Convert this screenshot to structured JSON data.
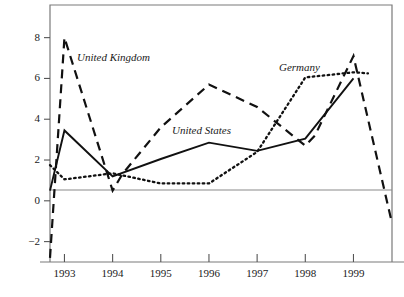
{
  "chart_data": {
    "type": "line",
    "title": "",
    "subtitle": "",
    "xlabel": "",
    "ylabel": "",
    "xlim": [
      1992.7,
      1999.8
    ],
    "ylim": [
      -3.0,
      9.6
    ],
    "grid": false,
    "legend_position": "inline-annotations",
    "zero_line": 0,
    "x_ticks": [
      "1993",
      "1994",
      "1995",
      "1996",
      "1997",
      "1998",
      "1999"
    ],
    "x_tick_values": [
      1993,
      1994,
      1995,
      1996,
      1997,
      1998,
      1999
    ],
    "y_ticks": [
      "8",
      "6",
      "4",
      "2",
      "0",
      "−2"
    ],
    "y_tick_values": [
      8,
      6,
      4,
      2,
      0,
      -2
    ],
    "series": [
      {
        "name": "United Kingdom",
        "style": "dashed",
        "color": "#111111",
        "x": [
          1992.7,
          1993.0,
          1994.0,
          1994.2,
          1995.0,
          1996.0,
          1997.0,
          1998.0,
          1998.2,
          1999.0,
          1999.8
        ],
        "values": [
          -2.8,
          8.0,
          0.5,
          1.3,
          3.6,
          5.7,
          4.6,
          2.7,
          3.2,
          7.1,
          -1.1
        ]
      },
      {
        "name": "United States",
        "style": "solid",
        "color": "#111111",
        "x": [
          1992.7,
          1993.0,
          1994.0,
          1995.0,
          1996.0,
          1997.0,
          1998.0,
          1999.0
        ],
        "values": [
          0.5,
          3.45,
          1.2,
          2.05,
          2.85,
          2.45,
          3.05,
          6.0
        ]
      },
      {
        "name": "Germany",
        "style": "dotted",
        "color": "#111111",
        "x": [
          1992.7,
          1993.0,
          1994.0,
          1995.0,
          1996.0,
          1997.0,
          1998.0,
          1999.0,
          1999.3
        ],
        "values": [
          1.75,
          1.05,
          1.35,
          0.85,
          0.85,
          2.4,
          6.05,
          6.3,
          6.25
        ]
      }
    ],
    "annotations": [
      {
        "text": "United Kingdom",
        "x_px": 77,
        "y_px": 52
      },
      {
        "text": "United States",
        "x_px": 172,
        "y_px": 125
      },
      {
        "text": "Germany",
        "x_px": 279,
        "y_px": 62
      }
    ]
  },
  "axes": {
    "frame_color": "#7a7a7a",
    "zero_line_color": "#8a8a8a",
    "tick_color": "#555555"
  }
}
